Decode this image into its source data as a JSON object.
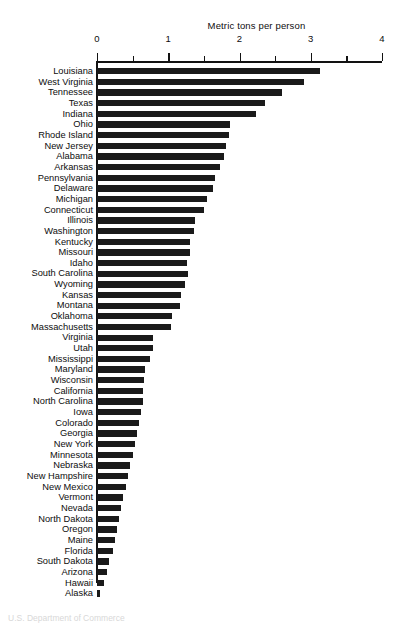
{
  "chart_data": {
    "type": "bar",
    "orientation": "horizontal",
    "title": "Metric tons per person",
    "xlabel": "Metric tons per person",
    "ylabel": "",
    "xlim": [
      0,
      4
    ],
    "xticks": [
      0,
      1,
      2,
      3,
      4
    ],
    "xtick_labels": [
      "0",
      "1",
      "2",
      "3",
      "4"
    ],
    "minor_tick_step": 0.5,
    "grid": false,
    "legend": false,
    "bar_color": "#1a1a1a",
    "categories": [
      "Louisiana",
      "West Virginia",
      "Tennessee",
      "Texas",
      "Indiana",
      "Ohio",
      "Rhode Island",
      "New Jersey",
      "Alabama",
      "Arkansas",
      "Pennsylvania",
      "Delaware",
      "Michigan",
      "Connecticut",
      "Illinois",
      "Washington",
      "Kentucky",
      "Missouri",
      "Idaho",
      "South Carolina",
      "Wyoming",
      "Kansas",
      "Montana",
      "Oklahoma",
      "Massachusetts",
      "Virginia",
      "Utah",
      "Mississippi",
      "Maryland",
      "Wisconsin",
      "California",
      "North Carolina",
      "Iowa",
      "Colorado",
      "Georgia",
      "New York",
      "Minnesota",
      "Nebraska",
      "New Hampshire",
      "New Mexico",
      "Vermont",
      "Nevada",
      "North Dakota",
      "Oregon",
      "Maine",
      "Florida",
      "South Dakota",
      "Arizona",
      "Hawaii",
      "Alaska"
    ],
    "values": [
      3.13,
      2.91,
      2.6,
      2.36,
      2.23,
      1.86,
      1.85,
      1.81,
      1.78,
      1.72,
      1.66,
      1.63,
      1.54,
      1.5,
      1.38,
      1.36,
      1.31,
      1.3,
      1.27,
      1.28,
      1.23,
      1.18,
      1.16,
      1.05,
      1.04,
      0.79,
      0.78,
      0.75,
      0.68,
      0.66,
      0.65,
      0.64,
      0.62,
      0.59,
      0.56,
      0.54,
      0.51,
      0.47,
      0.43,
      0.4,
      0.37,
      0.34,
      0.31,
      0.28,
      0.25,
      0.23,
      0.17,
      0.14,
      0.1,
      0.04
    ]
  },
  "footer": {
    "caption": "U.S. Department of Commerce"
  }
}
